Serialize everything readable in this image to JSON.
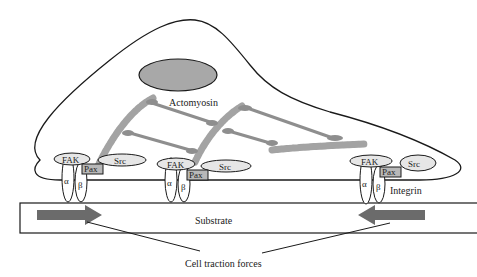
{
  "diagram": {
    "labels": {
      "actomyosin": "Actomyosin",
      "integrin": "Integrin",
      "substrate": "Substrate",
      "traction": "Cell traction forces"
    },
    "adhesions": [
      {
        "fak": "FAK",
        "src": "Src",
        "pax": "Pax",
        "alpha": "α",
        "beta": "β"
      },
      {
        "fak": "FAK",
        "src": "Src",
        "pax": "Pax",
        "alpha": "α",
        "beta": "β"
      },
      {
        "fak": "FAK",
        "src": "Src",
        "pax": "Pax",
        "alpha": "α",
        "beta": "β"
      }
    ],
    "arrows": [
      {
        "name": "left-traction-arrow",
        "direction": "right"
      },
      {
        "name": "right-traction-arrow",
        "direction": "left"
      }
    ],
    "colors": {
      "nucleus": "#a8a8a8",
      "actin": "#a9a9a9",
      "myosin": "#8e8e8e",
      "protein_fill": "#e6e6e6",
      "pax_fill": "#b8b8b8",
      "arrow": "#6b6b6b",
      "outline": "#1a1a1a"
    }
  }
}
